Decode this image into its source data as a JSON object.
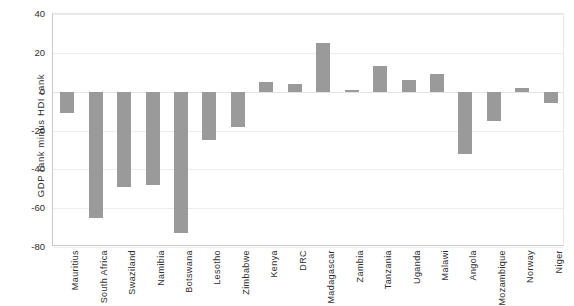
{
  "chart_data": {
    "type": "bar",
    "title": "",
    "xlabel": "",
    "ylabel": "GDP rank minus HDI rank",
    "ylim": [
      -80,
      40
    ],
    "ytick_values": [
      40,
      20,
      0,
      -20,
      -40,
      -60,
      -80
    ],
    "ytick_labels": [
      "40",
      "20",
      "0",
      "-20",
      "-40",
      "-60",
      "-80"
    ],
    "grid": true,
    "legend": "none",
    "orientation": "vertical",
    "bar_color": "#9a9a9a",
    "categories": [
      "Mauritius",
      "South Africa",
      "Swaziland",
      "Namibia",
      "Botswana",
      "Lesotho",
      "Zimbabwe",
      "Kenya",
      "DRC",
      "Madagascar",
      "Zambia",
      "Tanzania",
      "Uganda",
      "Malawi",
      "Angola",
      "Mozambique",
      "Norway",
      "Niger"
    ],
    "values": [
      -11,
      -65,
      -49,
      -48,
      -73,
      -25,
      -18,
      5,
      4,
      25,
      1,
      13,
      6,
      9,
      -32,
      -15,
      2,
      -6
    ]
  }
}
